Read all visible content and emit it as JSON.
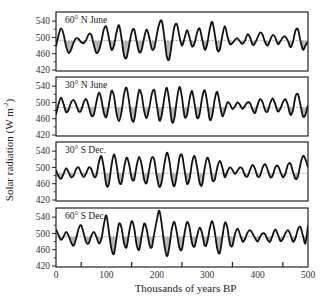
{
  "chart_data": {
    "type": "line",
    "title": "",
    "xlabel": "Thousands of years BP",
    "ylabel_text": "Solar radiation (W m",
    "ylabel_sup": "-2",
    "ylabel_close": ")",
    "ylabel": "Solar radiation (W m-2)",
    "xlim": [
      0,
      500
    ],
    "ylim": [
      420,
      560
    ],
    "x_ticks": [
      0,
      100,
      200,
      300,
      400,
      500
    ],
    "x_minor_ticks": [
      50,
      150,
      250,
      350,
      450
    ],
    "y_ticks": [
      420,
      460,
      500,
      540
    ],
    "y_minor_ticks": [
      440,
      480,
      520
    ],
    "grid": false,
    "fill_relative_to_mean": true,
    "x_step": 5,
    "panels": [
      {
        "name": "60° N June",
        "mean": 492,
        "x": [
          0,
          5,
          10,
          15,
          20,
          25,
          30,
          35,
          40,
          45,
          50,
          55,
          60,
          65,
          70,
          75,
          80,
          85,
          90,
          95,
          100,
          105,
          110,
          115,
          120,
          125,
          130,
          135,
          140,
          145,
          150,
          155,
          160,
          165,
          170,
          175,
          180,
          185,
          190,
          195,
          200,
          205,
          210,
          215,
          220,
          225,
          230,
          235,
          240,
          245,
          250,
          255,
          260,
          265,
          270,
          275,
          280,
          285,
          290,
          295,
          300,
          305,
          310,
          315,
          320,
          325,
          330,
          335,
          340,
          345,
          350,
          355,
          360,
          365,
          370,
          375,
          380,
          385,
          390,
          395,
          400,
          405,
          410,
          415,
          420,
          425,
          430,
          435,
          440,
          445,
          450,
          455,
          460,
          465,
          470,
          475,
          480,
          485,
          490,
          495,
          500
        ],
        "values": [
          478,
          505,
          522,
          508,
          478,
          462,
          470,
          488,
          498,
          496,
          488,
          486,
          494,
          508,
          506,
          482,
          462,
          468,
          490,
          520,
          526,
          498,
          470,
          480,
          512,
          530,
          498,
          456,
          450,
          480,
          512,
          520,
          490,
          464,
          470,
          500,
          520,
          500,
          472,
          474,
          506,
          534,
          540,
          500,
          452,
          448,
          488,
          526,
          532,
          502,
          480,
          498,
          518,
          500,
          478,
          486,
          512,
          522,
          496,
          470,
          484,
          520,
          538,
          508,
          470,
          470,
          504,
          528,
          504,
          484,
          486,
          494,
          498,
          490,
          484,
          492,
          508,
          500,
          482,
          486,
          500,
          512,
          506,
          488,
          480,
          494,
          506,
          500,
          484,
          490,
          500,
          502,
          492,
          476,
          488,
          516,
          520,
          492,
          470,
          480,
          490
        ]
      },
      {
        "name": "30° N June",
        "mean": 488,
        "x": [
          0,
          5,
          10,
          15,
          20,
          25,
          30,
          35,
          40,
          45,
          50,
          55,
          60,
          65,
          70,
          75,
          80,
          85,
          90,
          95,
          100,
          105,
          110,
          115,
          120,
          125,
          130,
          135,
          140,
          145,
          150,
          155,
          160,
          165,
          170,
          175,
          180,
          185,
          190,
          195,
          200,
          205,
          210,
          215,
          220,
          225,
          230,
          235,
          240,
          245,
          250,
          255,
          260,
          265,
          270,
          275,
          280,
          285,
          290,
          295,
          300,
          305,
          310,
          315,
          320,
          325,
          330,
          335,
          340,
          345,
          350,
          355,
          360,
          365,
          370,
          375,
          380,
          385,
          390,
          395,
          400,
          405,
          410,
          415,
          420,
          425,
          430,
          435,
          440,
          445,
          450,
          455,
          460,
          465,
          470,
          475,
          480,
          485,
          490,
          495,
          500
        ],
        "values": [
          470,
          496,
          512,
          496,
          476,
          482,
          500,
          506,
          494,
          478,
          480,
          500,
          508,
          490,
          468,
          470,
          500,
          524,
          508,
          474,
          464,
          494,
          528,
          516,
          474,
          454,
          476,
          520,
          536,
          502,
          460,
          456,
          496,
          530,
          518,
          478,
          462,
          486,
          520,
          530,
          494,
          456,
          470,
          512,
          536,
          500,
          452,
          462,
          508,
          538,
          512,
          466,
          470,
          508,
          528,
          496,
          462,
          472,
          512,
          530,
          500,
          458,
          468,
          508,
          526,
          496,
          466,
          480,
          500,
          496,
          484,
          490,
          500,
          494,
          484,
          492,
          500,
          498,
          482,
          474,
          494,
          508,
          500,
          480,
          478,
          498,
          510,
          496,
          478,
          484,
          500,
          508,
          494,
          470,
          480,
          514,
          520,
          494,
          466,
          470,
          494
        ]
      },
      {
        "name": "30° S Dec.",
        "mean": 486,
        "x": [
          0,
          5,
          10,
          15,
          20,
          25,
          30,
          35,
          40,
          45,
          50,
          55,
          60,
          65,
          70,
          75,
          80,
          85,
          90,
          95,
          100,
          105,
          110,
          115,
          120,
          125,
          130,
          135,
          140,
          145,
          150,
          155,
          160,
          165,
          170,
          175,
          180,
          185,
          190,
          195,
          200,
          205,
          210,
          215,
          220,
          225,
          230,
          235,
          240,
          245,
          250,
          255,
          260,
          265,
          270,
          275,
          280,
          285,
          290,
          295,
          300,
          305,
          310,
          315,
          320,
          325,
          330,
          335,
          340,
          345,
          350,
          355,
          360,
          365,
          370,
          375,
          380,
          385,
          390,
          395,
          400,
          405,
          410,
          415,
          420,
          425,
          430,
          435,
          440,
          445,
          450,
          455,
          460,
          465,
          470,
          475,
          480,
          485,
          490,
          495,
          500
        ],
        "values": [
          494,
          478,
          472,
          484,
          498,
          488,
          476,
          480,
          496,
          500,
          486,
          476,
          486,
          500,
          496,
          478,
          480,
          512,
          528,
          498,
          456,
          460,
          504,
          532,
          508,
          466,
          462,
          498,
          524,
          508,
          474,
          470,
          504,
          526,
          506,
          470,
          462,
          496,
          524,
          518,
          478,
          452,
          466,
          508,
          536,
          516,
          470,
          454,
          484,
          524,
          530,
          494,
          460,
          472,
          512,
          528,
          500,
          462,
          458,
          498,
          524,
          508,
          470,
          470,
          500,
          516,
          500,
          476,
          490,
          500,
          494,
          484,
          492,
          500,
          496,
          480,
          478,
          494,
          506,
          496,
          478,
          480,
          500,
          508,
          494,
          476,
          480,
          500,
          504,
          490,
          476,
          484,
          506,
          510,
          490,
          472,
          478,
          508,
          528,
          520,
          500
        ]
      },
      {
        "name": "60° S Dec.",
        "mean": 492,
        "x": [
          0,
          5,
          10,
          15,
          20,
          25,
          30,
          35,
          40,
          45,
          50,
          55,
          60,
          65,
          70,
          75,
          80,
          85,
          90,
          95,
          100,
          105,
          110,
          115,
          120,
          125,
          130,
          135,
          140,
          145,
          150,
          155,
          160,
          165,
          170,
          175,
          180,
          185,
          190,
          195,
          200,
          205,
          210,
          215,
          220,
          225,
          230,
          235,
          240,
          245,
          250,
          255,
          260,
          265,
          270,
          275,
          280,
          285,
          290,
          295,
          300,
          305,
          310,
          315,
          320,
          325,
          330,
          335,
          340,
          345,
          350,
          355,
          360,
          365,
          370,
          375,
          380,
          385,
          390,
          395,
          400,
          405,
          410,
          415,
          420,
          425,
          430,
          435,
          440,
          445,
          450,
          455,
          460,
          465,
          470,
          475,
          480,
          485,
          490,
          495,
          500
        ],
        "values": [
          510,
          496,
          484,
          492,
          504,
          494,
          478,
          470,
          488,
          512,
          520,
          500,
          478,
          476,
          494,
          504,
          492,
          476,
          486,
          522,
          544,
          504,
          462,
          450,
          488,
          524,
          514,
          476,
          466,
          502,
          530,
          514,
          472,
          460,
          494,
          524,
          510,
          474,
          466,
          500,
          532,
          556,
          520,
          472,
          444,
          468,
          512,
          528,
          500,
          464,
          462,
          500,
          528,
          514,
          476,
          468,
          494,
          514,
          500,
          470,
          478,
          512,
          530,
          504,
          462,
          452,
          490,
          526,
          514,
          474,
          470,
          498,
          512,
          498,
          480,
          486,
          502,
          508,
          500,
          488,
          480,
          492,
          500,
          498,
          484,
          480,
          496,
          510,
          498,
          482,
          486,
          500,
          508,
          498,
          480,
          488,
          510,
          516,
          494,
          476,
          520
        ]
      }
    ]
  }
}
